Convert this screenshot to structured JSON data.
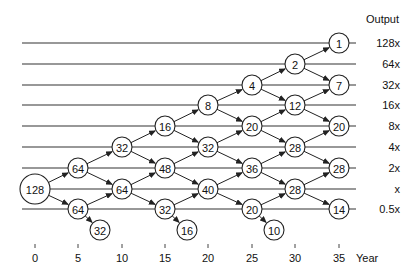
{
  "header": {
    "output_label": "Output"
  },
  "levels": [
    {
      "label": "128x",
      "y": 43
    },
    {
      "label": "64x",
      "y": 64
    },
    {
      "label": "32x",
      "y": 85
    },
    {
      "label": "16x",
      "y": 105
    },
    {
      "label": "8x",
      "y": 126
    },
    {
      "label": "4x",
      "y": 147
    },
    {
      "label": "2x",
      "y": 168
    },
    {
      "label": "x",
      "y": 189
    },
    {
      "label": "0.5x",
      "y": 209
    }
  ],
  "x_axis": {
    "label": "Year",
    "ticks": [
      {
        "label": "0",
        "x": 35
      },
      {
        "label": "5",
        "x": 78
      },
      {
        "label": "10",
        "x": 122
      },
      {
        "label": "15",
        "x": 165
      },
      {
        "label": "20",
        "x": 208
      },
      {
        "label": "25",
        "x": 252
      },
      {
        "label": "30",
        "x": 295
      },
      {
        "label": "35",
        "x": 339
      }
    ]
  },
  "nodes": [
    {
      "id": "n0",
      "value": "128",
      "x": 35,
      "y": 189,
      "r": 15
    },
    {
      "id": "n5a",
      "value": "64",
      "x": 78,
      "y": 168,
      "r": 10
    },
    {
      "id": "n5b",
      "value": "64",
      "x": 78,
      "y": 209,
      "r": 10
    },
    {
      "id": "n5c",
      "value": "32",
      "x": 100,
      "y": 230,
      "r": 10
    },
    {
      "id": "n10a",
      "value": "32",
      "x": 122,
      "y": 147,
      "r": 10
    },
    {
      "id": "n10b",
      "value": "64",
      "x": 122,
      "y": 189,
      "r": 10
    },
    {
      "id": "n15a",
      "value": "16",
      "x": 165,
      "y": 126,
      "r": 10
    },
    {
      "id": "n15b",
      "value": "48",
      "x": 165,
      "y": 168,
      "r": 10
    },
    {
      "id": "n15c",
      "value": "32",
      "x": 165,
      "y": 209,
      "r": 10
    },
    {
      "id": "n15d",
      "value": "16",
      "x": 187,
      "y": 230,
      "r": 10
    },
    {
      "id": "n20a",
      "value": "8",
      "x": 208,
      "y": 105,
      "r": 10
    },
    {
      "id": "n20b",
      "value": "32",
      "x": 208,
      "y": 147,
      "r": 10
    },
    {
      "id": "n20c",
      "value": "40",
      "x": 208,
      "y": 189,
      "r": 10
    },
    {
      "id": "n25a",
      "value": "4",
      "x": 252,
      "y": 85,
      "r": 10
    },
    {
      "id": "n25b",
      "value": "20",
      "x": 252,
      "y": 126,
      "r": 10
    },
    {
      "id": "n25c",
      "value": "36",
      "x": 252,
      "y": 168,
      "r": 10
    },
    {
      "id": "n25d",
      "value": "20",
      "x": 252,
      "y": 209,
      "r": 10
    },
    {
      "id": "n25e",
      "value": "10",
      "x": 274,
      "y": 230,
      "r": 10
    },
    {
      "id": "n30a",
      "value": "2",
      "x": 295,
      "y": 64,
      "r": 10
    },
    {
      "id": "n30b",
      "value": "12",
      "x": 295,
      "y": 105,
      "r": 10
    },
    {
      "id": "n30c",
      "value": "28",
      "x": 295,
      "y": 147,
      "r": 10
    },
    {
      "id": "n30d",
      "value": "28",
      "x": 295,
      "y": 189,
      "r": 10
    },
    {
      "id": "n35a",
      "value": "1",
      "x": 339,
      "y": 43,
      "r": 10
    },
    {
      "id": "n35b",
      "value": "7",
      "x": 339,
      "y": 85,
      "r": 10
    },
    {
      "id": "n35c",
      "value": "20",
      "x": 339,
      "y": 126,
      "r": 10
    },
    {
      "id": "n35d",
      "value": "28",
      "x": 339,
      "y": 168,
      "r": 10
    },
    {
      "id": "n35e",
      "value": "14",
      "x": 339,
      "y": 209,
      "r": 10
    }
  ],
  "edges": [
    [
      "n0",
      "n5a"
    ],
    [
      "n0",
      "n5b"
    ],
    [
      "n5a",
      "n10a"
    ],
    [
      "n5a",
      "n10b"
    ],
    [
      "n5b",
      "n10b"
    ],
    [
      "n5b",
      "n5c"
    ],
    [
      "n10a",
      "n15a"
    ],
    [
      "n10a",
      "n15b"
    ],
    [
      "n10b",
      "n15b"
    ],
    [
      "n10b",
      "n15c"
    ],
    [
      "n15c",
      "n15d"
    ],
    [
      "n15a",
      "n20a"
    ],
    [
      "n15a",
      "n20b"
    ],
    [
      "n15b",
      "n20b"
    ],
    [
      "n15b",
      "n20c"
    ],
    [
      "n15c",
      "n20c"
    ],
    [
      "n20a",
      "n25a"
    ],
    [
      "n20a",
      "n25b"
    ],
    [
      "n20b",
      "n25b"
    ],
    [
      "n20b",
      "n25c"
    ],
    [
      "n20c",
      "n25c"
    ],
    [
      "n20c",
      "n25d"
    ],
    [
      "n25d",
      "n25e"
    ],
    [
      "n25a",
      "n30a"
    ],
    [
      "n25a",
      "n30b"
    ],
    [
      "n25b",
      "n30b"
    ],
    [
      "n25b",
      "n30c"
    ],
    [
      "n25c",
      "n30c"
    ],
    [
      "n25c",
      "n30d"
    ],
    [
      "n25d",
      "n30d"
    ],
    [
      "n30a",
      "n35a"
    ],
    [
      "n30a",
      "n35b"
    ],
    [
      "n30b",
      "n35b"
    ],
    [
      "n30b",
      "n35c"
    ],
    [
      "n30c",
      "n35c"
    ],
    [
      "n30c",
      "n35d"
    ],
    [
      "n30d",
      "n35d"
    ],
    [
      "n30d",
      "n35e"
    ]
  ]
}
